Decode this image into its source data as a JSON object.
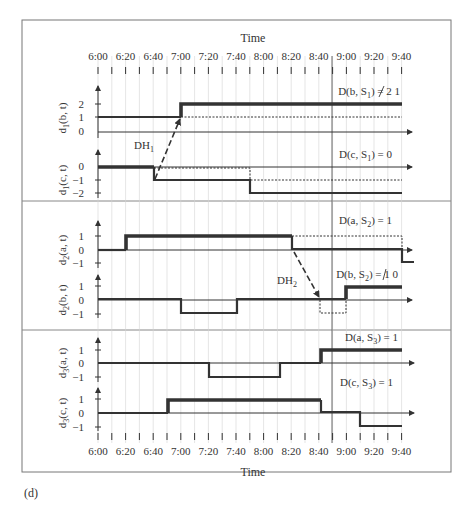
{
  "figure": {
    "caption": "(d)",
    "frame_color": "#777777",
    "line_color": "#333333",
    "grid_color": "#cccccc",
    "highlight_time": "8:50"
  },
  "chart_data": {
    "type": "line",
    "subtype": "step",
    "title": "",
    "xlabel": "Time",
    "x_ticks": [
      "6:00",
      "6:20",
      "6:40",
      "7:00",
      "7:20",
      "7:40",
      "8:00",
      "8:20",
      "8:40",
      "9:00",
      "9:20",
      "9:40"
    ],
    "x_range": [
      "6:00",
      "9:40"
    ],
    "x_minor_step_minutes": 10,
    "grid": true,
    "vertical_marker": "8:50",
    "panels": [
      {
        "id": "S1",
        "series": [
          {
            "name": "d1(b, t)",
            "label_main": "d",
            "label_sub": "1",
            "label_rest": "(b, t)",
            "y_ticks": [
              2,
              1,
              0
            ],
            "ylim": [
              0,
              2.6
            ],
            "solid": [
              [
                "6:00",
                1
              ],
              [
                "7:00",
                1
              ],
              [
                "7:00",
                2
              ],
              [
                "9:40",
                2
              ]
            ],
            "dotted": [
              [
                "7:00",
                1
              ],
              [
                "9:40",
                1
              ]
            ],
            "annotation": "D(b, S1) = 2 (struck) 1"
          },
          {
            "name": "d1(c, t)",
            "label_main": "d",
            "label_sub": "1",
            "label_rest": "(c, t)",
            "y_ticks": [
              0,
              -1,
              -2
            ],
            "ylim": [
              -2.2,
              0.6
            ],
            "solid": [
              [
                "6:00",
                0
              ],
              [
                "6:40",
                0
              ],
              [
                "6:40",
                -1
              ],
              [
                "7:50",
                -1
              ],
              [
                "7:50",
                -2
              ],
              [
                "9:40",
                -2
              ]
            ],
            "dotted": [
              [
                "6:40",
                0
              ],
              [
                "7:50",
                0
              ],
              [
                "7:50",
                -1
              ],
              [
                "9:40",
                -1
              ]
            ],
            "annotation": "D(c, S1) = 0"
          }
        ],
        "arrows": [
          {
            "label": "DH1",
            "from": [
              "6:40",
              -1
            ],
            "to": [
              "7:00",
              1
            ]
          }
        ]
      },
      {
        "id": "S2",
        "series": [
          {
            "name": "d2(a, t)",
            "label_main": "d",
            "label_sub": "2",
            "label_rest": "(a, t)",
            "y_ticks": [
              1,
              0,
              -1
            ],
            "ylim": [
              -1.2,
              1.8
            ],
            "solid": [
              [
                "6:00",
                0
              ],
              [
                "6:20",
                0
              ],
              [
                "6:20",
                1
              ],
              [
                "8:20",
                1
              ],
              [
                "8:20",
                0
              ],
              [
                "9:40",
                0
              ],
              [
                "9:40",
                -1
              ],
              [
                "9:50",
                -1
              ]
            ],
            "dotted": [
              [
                "8:20",
                1
              ],
              [
                "9:40",
                1
              ],
              [
                "9:40",
                0
              ]
            ],
            "annotation": "D(a, S2) = 1"
          },
          {
            "name": "d2(b, t)",
            "label_main": "d",
            "label_sub": "2",
            "label_rest": "(b, t)",
            "y_ticks": [
              1,
              0,
              -1
            ],
            "ylim": [
              -1.2,
              1.6
            ],
            "solid": [
              [
                "6:00",
                0
              ],
              [
                "7:00",
                0
              ],
              [
                "7:00",
                -1
              ],
              [
                "7:40",
                -1
              ],
              [
                "7:40",
                0
              ],
              [
                "9:00",
                0
              ],
              [
                "9:00",
                1
              ],
              [
                "9:40",
                1
              ]
            ],
            "dotted": [
              [
                "8:40",
                0
              ],
              [
                "8:40",
                -1
              ],
              [
                "9:00",
                -1
              ],
              [
                "9:00",
                0
              ]
            ],
            "annotation": "D(b, S2) = 1 (struck) 0"
          }
        ],
        "arrows": [
          {
            "label": "DH2",
            "from": [
              "8:20",
              0
            ],
            "to": [
              "8:40",
              0
            ]
          }
        ]
      },
      {
        "id": "S3",
        "series": [
          {
            "name": "d3(a, t)",
            "label_main": "d",
            "label_sub": "3",
            "label_rest": "(a, t)",
            "y_ticks": [
              1,
              0,
              -1
            ],
            "ylim": [
              -1.2,
              1.6
            ],
            "solid": [
              [
                "6:00",
                0
              ],
              [
                "7:20",
                0
              ],
              [
                "7:20",
                -1
              ],
              [
                "8:10",
                -1
              ],
              [
                "8:10",
                0
              ],
              [
                "8:40",
                0
              ],
              [
                "8:40",
                1
              ],
              [
                "9:40",
                1
              ]
            ],
            "dotted": [],
            "annotation": "D(a, S3) = 1"
          },
          {
            "name": "d3(c, t)",
            "label_main": "d",
            "label_sub": "3",
            "label_rest": "(c, t)",
            "y_ticks": [
              1,
              0,
              -1
            ],
            "ylim": [
              -1.2,
              1.6
            ],
            "solid": [
              [
                "6:00",
                0
              ],
              [
                "6:50",
                0
              ],
              [
                "6:50",
                1
              ],
              [
                "8:40",
                1
              ],
              [
                "8:40",
                0
              ],
              [
                "9:10",
                0
              ],
              [
                "9:10",
                -1
              ],
              [
                "9:40",
                -1
              ]
            ],
            "dotted": [],
            "annotation": "D(c, S3) = 1"
          }
        ],
        "arrows": []
      }
    ]
  },
  "labels": {
    "time_top": "Time",
    "time_bottom": "Time",
    "ticks": [
      "6:00",
      "6:20",
      "6:40",
      "7:00",
      "7:20",
      "7:40",
      "8:00",
      "8:20",
      "8:40",
      "9:00",
      "9:20",
      "9:40"
    ],
    "ann": {
      "b1_pre": "D(b, S",
      "b1_sub": "1",
      "b1_post": ") = ",
      "b1_struck": "2",
      "b1_val": " 1",
      "c1_pre": "D(c, S",
      "c1_sub": "1",
      "c1_post": ") = 0",
      "a2_pre": "D(a, S",
      "a2_sub": "2",
      "a2_post": ") = 1",
      "b2_pre": "D(b, S",
      "b2_sub": "2",
      "b2_post": ") = ",
      "b2_struck": "1",
      "b2_val": " 0",
      "a3_pre": "D(a, S",
      "a3_sub": "3",
      "a3_post": ") = 1",
      "c3_pre": "D(c, S",
      "c3_sub": "3",
      "c3_post": ") = 1",
      "dh1_main": "DH",
      "dh1_sub": "1",
      "dh2_main": "DH",
      "dh2_sub": "2"
    },
    "ylabels": {
      "p1a": {
        "m": "d",
        "s": "1",
        "r": "(b, t)"
      },
      "p1b": {
        "m": "d",
        "s": "1",
        "r": "(c, t)"
      },
      "p2a": {
        "m": "d",
        "s": "2",
        "r": "(a, t)"
      },
      "p2b": {
        "m": "d",
        "s": "2",
        "r": "(b, t)"
      },
      "p3a": {
        "m": "d",
        "s": "3",
        "r": "(a, t)"
      },
      "p3b": {
        "m": "d",
        "s": "3",
        "r": "(c, t)"
      }
    },
    "yticks": {
      "p1a": [
        "2",
        "1",
        "0"
      ],
      "p1b": [
        "0",
        "−1",
        "−2"
      ],
      "p2a": [
        "1",
        "0",
        "−1"
      ],
      "p2b": [
        "1",
        "0",
        "−1"
      ],
      "p3a": [
        "1",
        "0",
        "−1"
      ],
      "p3b": [
        "1",
        "0",
        "−1"
      ]
    }
  }
}
